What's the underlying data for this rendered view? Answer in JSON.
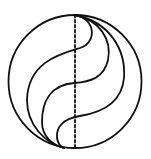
{
  "diagram": {
    "type": "geometric-figure",
    "colors": {
      "background": "#ffffff",
      "stroke": "#111111"
    },
    "circle": {
      "cx": 75,
      "cy": 81.5,
      "r": 66.5,
      "stroke_width": 1.8
    },
    "diameter": {
      "x": 75,
      "y1": 15,
      "y2": 148,
      "style": "dashed",
      "dash": "2.5 2.5",
      "stroke_width": 1.8
    },
    "curves": [
      {
        "id": "curve-1",
        "d": "M75,15 C95,18 98,42 80,48 C60,54 28,62 27,100 C27,125 45,143 64,148"
      },
      {
        "id": "curve-2",
        "d": "M75,15 C100,20 112,40 108,60 C104,78 90,82 74,83 C50,85 42,102 42,122 C42,136 52,145 64,148"
      },
      {
        "id": "curve-3",
        "d": "M75,15 C110,22 126,50 124,78 C122,100 105,112 80,116 C62,119 56,128 57,138 C58,144 61,147 64,148"
      }
    ],
    "stroke_width": 1.8
  }
}
